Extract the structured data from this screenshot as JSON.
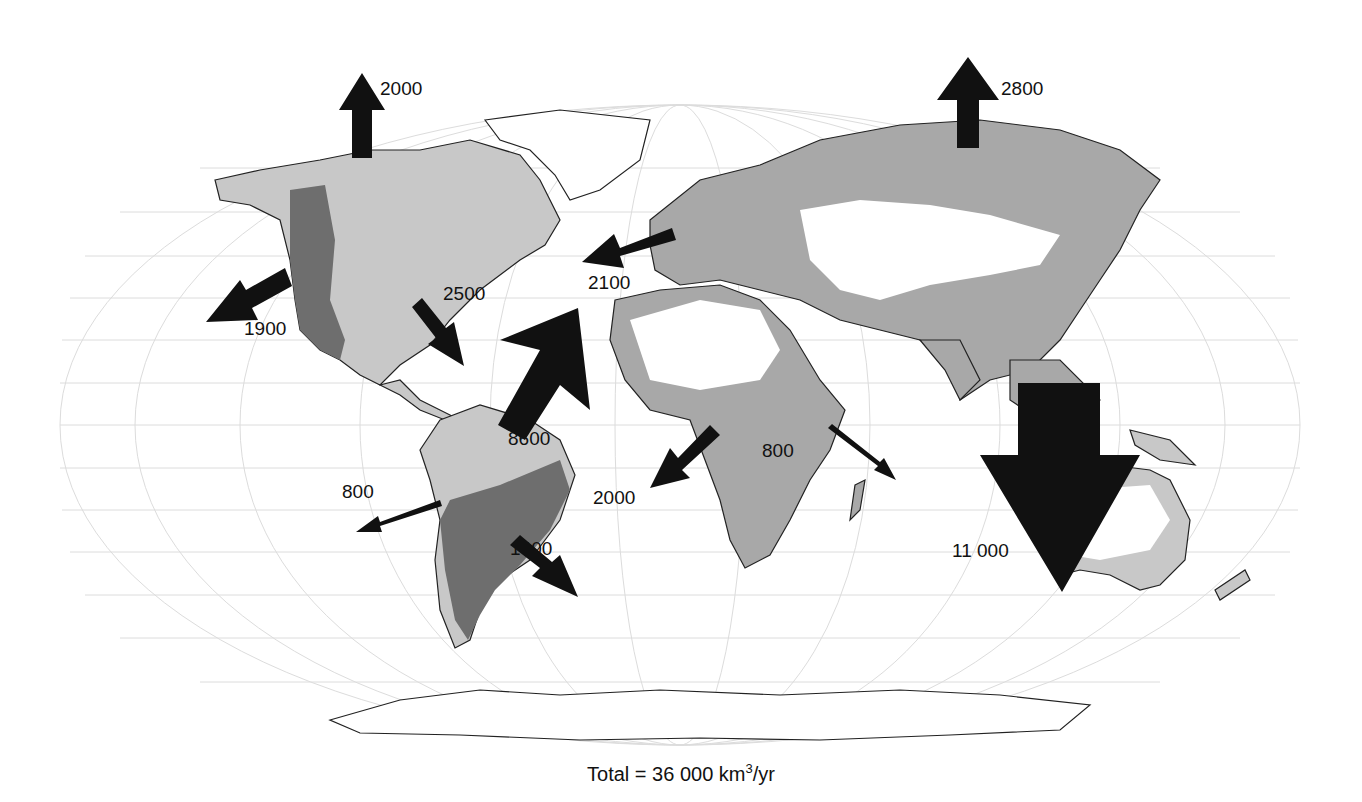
{
  "caption": {
    "prefix": "Total = 36 000 km",
    "sup": "3",
    "suffix": "/yr"
  },
  "colors": {
    "ocean": "#ffffff",
    "graticule": "#d8d8d8",
    "exorheic_light": "#c8c8c8",
    "exorheic_medium": "#a8a8a8",
    "exorheic_dark": "#6e6e6e",
    "endorheic": "#ffffff",
    "arrow": "#111111",
    "coast": "#222222",
    "river": "#7a7a7a"
  },
  "flows": [
    {
      "id": "arctic-north-america",
      "value": "2000",
      "direction": "north"
    },
    {
      "id": "arctic-eurasia",
      "value": "2800",
      "direction": "north"
    },
    {
      "id": "north-pacific-north-america",
      "value": "1900",
      "direction": "southwest"
    },
    {
      "id": "atlantic-north-america",
      "value": "2500",
      "direction": "southeast"
    },
    {
      "id": "atlantic-europe",
      "value": "2100",
      "direction": "west"
    },
    {
      "id": "atlantic-south-america",
      "value": "8600",
      "direction": "northeast"
    },
    {
      "id": "pacific-south-america",
      "value": "800",
      "direction": "west"
    },
    {
      "id": "south-atlantic-south-america",
      "value": "1400",
      "direction": "southeast"
    },
    {
      "id": "atlantic-africa",
      "value": "2000",
      "direction": "southwest"
    },
    {
      "id": "indian-africa",
      "value": "800",
      "direction": "southeast"
    },
    {
      "id": "indo-pacific-asia",
      "value": "11 000",
      "direction": "south"
    }
  ]
}
